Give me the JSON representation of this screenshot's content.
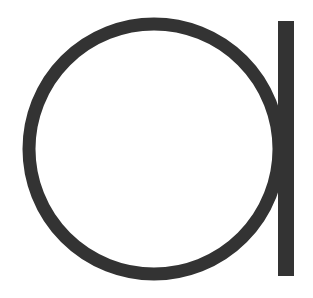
{
  "glyph": {
    "character": "a",
    "description": "Large geometric lowercase letter a (circle with vertical stem)",
    "color": "#333333",
    "background": "#ffffff"
  }
}
